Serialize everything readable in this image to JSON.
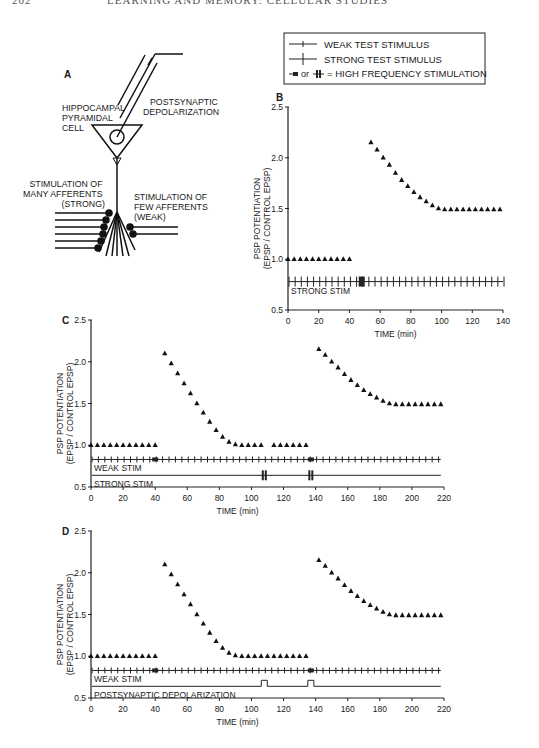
{
  "page": {
    "page_number": "202",
    "running_title": "LEARNING AND MEMORY: CELLULAR STUDIES"
  },
  "legend": {
    "items": [
      {
        "symbol": "weak-test-stimulus",
        "label": "WEAK TEST STIMULUS"
      },
      {
        "symbol": "strong-test-stimulus",
        "label": "STRONG TEST STIMULUS"
      },
      {
        "symbol": "high-frequency-stimulation",
        "label": "or",
        "label2": "= HIGH FREQUENCY STIMULATION"
      }
    ]
  },
  "panel_a": {
    "letter": "A",
    "cell_label": [
      "HIPPOCAMPAL",
      "PYRAMIDAL",
      "CELL"
    ],
    "electrode_label": [
      "POSTSYNAPTIC",
      "DEPOLARIZATION"
    ],
    "strong_label": [
      "STIMULATION OF",
      "MANY AFFERENTS",
      "(STRONG)"
    ],
    "weak_label": [
      "STIMULATION OF",
      "FEW AFFERENTS",
      "(WEAK)"
    ]
  },
  "chart_data": [
    {
      "id": "B",
      "type": "scatter",
      "title": "B",
      "xlabel": "TIME  (min)",
      "ylabel": [
        "PSP  POTENTIATION",
        "(EPSP / CONTROL  EPSP)"
      ],
      "xlim": [
        0,
        140
      ],
      "ylim": [
        0.5,
        2.5
      ],
      "xticks": [
        0,
        20,
        40,
        60,
        80,
        100,
        120,
        140
      ],
      "yticks": [
        0.5,
        1.0,
        1.5,
        2.0,
        2.5
      ],
      "ytick_labels": [
        "0.5",
        "1.0",
        "1.5",
        "2.0",
        "2.5"
      ],
      "series": [
        {
          "name": "PSP",
          "marker": "triangle",
          "x": [
            0,
            4,
            8,
            12,
            16,
            20,
            24,
            28,
            32,
            36,
            40,
            54,
            58,
            62,
            66,
            70,
            74,
            78,
            82,
            86,
            90,
            94,
            98,
            102,
            106,
            110,
            114,
            118,
            122,
            126,
            130,
            134,
            138
          ],
          "y": [
            1.0,
            1.0,
            1.0,
            1.0,
            1.0,
            1.0,
            1.0,
            1.0,
            1.0,
            1.0,
            1.0,
            2.15,
            2.08,
            2.0,
            1.93,
            1.85,
            1.78,
            1.72,
            1.66,
            1.61,
            1.57,
            1.53,
            1.5,
            1.49,
            1.49,
            1.49,
            1.49,
            1.49,
            1.49,
            1.49,
            1.49,
            1.49,
            1.49
          ]
        }
      ],
      "stim_lines": [
        {
          "label": "STRONG STIM",
          "type": "strong",
          "y": 0.78,
          "x_start": 0,
          "x_end": 140,
          "tick_every": 4,
          "hfs_at": [
            48
          ]
        }
      ]
    },
    {
      "id": "C",
      "type": "scatter",
      "title": "C",
      "xlabel": "TIME  (min)",
      "ylabel": [
        "PSP  POTENTIATION",
        "(EPSP / CONTROL  EPSP)"
      ],
      "xlim": [
        0,
        220
      ],
      "ylim": [
        0.5,
        2.5
      ],
      "xticks": [
        0,
        20,
        40,
        60,
        80,
        100,
        120,
        140,
        160,
        180,
        200,
        220
      ],
      "yticks": [
        0.5,
        1.0,
        1.5,
        2.0,
        2.5
      ],
      "ytick_labels": [
        "0.5",
        "1.0",
        "1.5",
        "2.0",
        "2.5"
      ],
      "series": [
        {
          "name": "PSP",
          "marker": "triangle",
          "x": [
            0,
            4,
            8,
            12,
            16,
            20,
            24,
            28,
            32,
            36,
            40,
            46,
            50,
            54,
            58,
            62,
            66,
            70,
            74,
            78,
            82,
            86,
            90,
            94,
            98,
            102,
            106,
            114,
            118,
            122,
            126,
            130,
            134,
            142,
            146,
            150,
            154,
            158,
            162,
            166,
            170,
            174,
            178,
            182,
            186,
            190,
            194,
            198,
            202,
            206,
            210,
            214,
            218
          ],
          "y": [
            1.0,
            1.0,
            1.0,
            1.0,
            1.0,
            1.0,
            1.0,
            1.0,
            1.0,
            1.0,
            1.0,
            2.1,
            1.98,
            1.86,
            1.74,
            1.62,
            1.5,
            1.39,
            1.28,
            1.18,
            1.1,
            1.04,
            1.01,
            1.0,
            1.0,
            1.0,
            1.0,
            1.0,
            1.0,
            1.0,
            1.0,
            1.0,
            1.0,
            2.15,
            2.08,
            2.0,
            1.93,
            1.85,
            1.78,
            1.72,
            1.66,
            1.61,
            1.57,
            1.53,
            1.5,
            1.49,
            1.49,
            1.49,
            1.49,
            1.49,
            1.49,
            1.49,
            1.49
          ]
        }
      ],
      "stim_lines": [
        {
          "label": "WEAK STIM",
          "type": "weak",
          "y": 0.83,
          "x_start": 0,
          "x_end": 218,
          "tick_every": 4,
          "hfs_at": [
            40,
            137
          ]
        },
        {
          "label": "STRONG STIM",
          "type": "strong-line",
          "y": 0.64,
          "x_start": 0,
          "x_end": 218,
          "hfs_at": [
            108,
            137
          ]
        }
      ]
    },
    {
      "id": "D",
      "type": "scatter",
      "title": "D",
      "xlabel": "TIME  (min)",
      "ylabel": [
        "PSP  POTENTIATION",
        "(EPSP / CONTROL  EPSP)"
      ],
      "xlim": [
        0,
        220
      ],
      "ylim": [
        0.5,
        2.5
      ],
      "xticks": [
        0,
        20,
        40,
        60,
        80,
        100,
        120,
        140,
        160,
        180,
        200,
        220
      ],
      "yticks": [
        0.5,
        1.0,
        1.5,
        2.0,
        2.5
      ],
      "ytick_labels": [
        "0.5",
        "1.0",
        "1.5",
        "2.0",
        "2.5"
      ],
      "series": [
        {
          "name": "PSP",
          "marker": "triangle",
          "x": [
            0,
            4,
            8,
            12,
            16,
            20,
            24,
            28,
            32,
            36,
            40,
            46,
            50,
            54,
            58,
            62,
            66,
            70,
            74,
            78,
            82,
            86,
            90,
            94,
            98,
            102,
            106,
            110,
            114,
            118,
            122,
            126,
            130,
            134,
            142,
            146,
            150,
            154,
            158,
            162,
            166,
            170,
            174,
            178,
            182,
            186,
            190,
            194,
            198,
            202,
            206,
            210,
            214,
            218
          ],
          "y": [
            1.0,
            1.0,
            1.0,
            1.0,
            1.0,
            1.0,
            1.0,
            1.0,
            1.0,
            1.0,
            1.0,
            2.1,
            1.98,
            1.86,
            1.74,
            1.62,
            1.5,
            1.39,
            1.28,
            1.18,
            1.1,
            1.04,
            1.01,
            1.0,
            1.0,
            1.0,
            1.0,
            1.0,
            1.0,
            1.0,
            1.0,
            1.0,
            1.0,
            1.0,
            2.15,
            2.08,
            2.0,
            1.93,
            1.85,
            1.78,
            1.72,
            1.66,
            1.61,
            1.57,
            1.53,
            1.5,
            1.49,
            1.49,
            1.49,
            1.49,
            1.49,
            1.49,
            1.49,
            1.49
          ]
        }
      ],
      "stim_lines": [
        {
          "label": "WEAK STIM",
          "type": "weak",
          "y": 0.83,
          "x_start": 0,
          "x_end": 218,
          "tick_every": 4,
          "hfs_at": [
            40,
            137
          ]
        },
        {
          "label": "POSTSYNAPTIC DEPOLARIZATION",
          "type": "pulse-line",
          "y": 0.64,
          "x_start": 0,
          "x_end": 218,
          "pulses_at": [
            108,
            137
          ]
        }
      ]
    }
  ]
}
